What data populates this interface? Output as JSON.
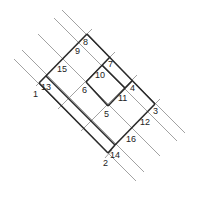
{
  "diagram": {
    "type": "node-grid",
    "colors": {
      "thick_line": "#2a2a2a",
      "thin_line": "#8a8a8a",
      "label": "#222222",
      "background": "#ffffff"
    },
    "nodes": [
      {
        "id": "1",
        "label": "1",
        "x": 39,
        "y": 83,
        "lx": 33,
        "ly": 97
      },
      {
        "id": "2",
        "label": "2",
        "x": 108,
        "y": 153,
        "lx": 103,
        "ly": 166
      },
      {
        "id": "3",
        "label": "3",
        "x": 155,
        "y": 104,
        "lx": 153,
        "ly": 114
      },
      {
        "id": "4",
        "label": "4",
        "x": 132,
        "y": 81,
        "lx": 130,
        "ly": 91
      },
      {
        "id": "5",
        "label": "5",
        "x": 108,
        "y": 106,
        "lx": 104,
        "ly": 117
      },
      {
        "id": "6",
        "label": "6",
        "x": 86,
        "y": 82,
        "lx": 82,
        "ly": 93
      },
      {
        "id": "7",
        "label": "7",
        "x": 110,
        "y": 57,
        "lx": 108,
        "ly": 67
      },
      {
        "id": "8",
        "label": "8",
        "x": 87,
        "y": 34,
        "lx": 83,
        "ly": 45
      },
      {
        "id": "9",
        "label": "9",
        "x": 78,
        "y": 44,
        "lx": 75,
        "ly": 54
      },
      {
        "id": "10",
        "label": "10",
        "x": 102,
        "y": 65,
        "lx": 95,
        "ly": 78
      },
      {
        "id": "11",
        "label": "11",
        "x": 125,
        "y": 88,
        "lx": 118,
        "ly": 101
      },
      {
        "id": "12",
        "label": "12",
        "x": 147,
        "y": 112,
        "lx": 140,
        "ly": 125
      },
      {
        "id": "13",
        "label": "13",
        "x": 39,
        "y": 83,
        "lx": 41,
        "ly": 90
      },
      {
        "id": "14",
        "label": "14",
        "x": 115,
        "y": 145,
        "lx": 110,
        "ly": 158
      },
      {
        "id": "15",
        "label": "15",
        "x": 63,
        "y": 59,
        "lx": 57,
        "ly": 72
      },
      {
        "id": "16",
        "label": "16",
        "x": 132,
        "y": 129,
        "lx": 126,
        "ly": 142
      }
    ]
  }
}
